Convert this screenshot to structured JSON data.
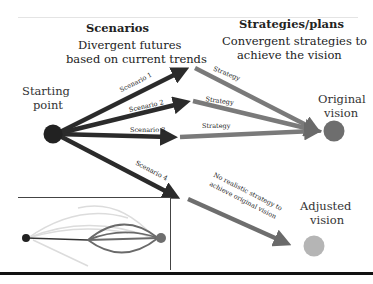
{
  "scenarios": {
    "title": "Scenarios",
    "subtitle_line1": "Divergent futures",
    "subtitle_line2": "based on current trends",
    "labels": [
      "Scenario 1",
      "Scenario 2",
      "Scenario 3",
      "Scenario 4"
    ]
  },
  "strategies": {
    "title": "Strategies/plans",
    "subtitle_line1": "Convergent strategies to",
    "subtitle_line2": "achieve the vision",
    "labels": [
      "Strategy",
      "Strategy",
      "Strategy"
    ],
    "no_strategy_line1": "No realistic strategy to",
    "no_strategy_line2": "achieve original vision"
  },
  "nodes": {
    "start_line1": "Starting",
    "start_line2": "point",
    "original_line1": "Original",
    "original_line2": "vision",
    "adjusted_line1": "Adjusted",
    "adjusted_line2": "vision"
  },
  "colors": {
    "scenario_arrow": "#2b2b2b",
    "strategy_arrow": "#7a7a7a",
    "start_node": "#222222",
    "original_node": "#6e6e6e",
    "adjusted_node": "#b5b5b5"
  }
}
